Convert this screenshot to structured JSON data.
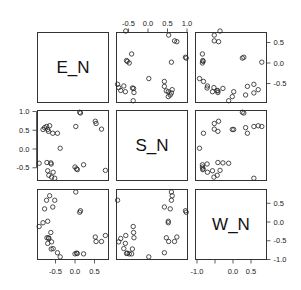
{
  "chart_data": {
    "type": "scatter",
    "subtype": "pairs-matrix",
    "title": "",
    "variables": [
      "E_N",
      "S_N",
      "W_N"
    ],
    "grid": false,
    "legend": null,
    "marker": "open-circle",
    "axes": {
      "top": {
        "column": 1,
        "ticks": [
          -0.5,
          0.0,
          0.5,
          1.0
        ],
        "labels": [
          "-0.5",
          "0.0",
          "0.5",
          "1.0"
        ]
      },
      "right_row0": {
        "ticks": [
          0.5,
          0.0,
          -0.5
        ],
        "labels": [
          "0.5",
          "0.0",
          "-0.5"
        ]
      },
      "left_row1": {
        "ticks": [
          1.0,
          0.5,
          0.0,
          -0.5
        ],
        "labels": [
          "1.0",
          "0.5",
          "0.0",
          "-0.5"
        ]
      },
      "right_row2": {
        "ticks": [
          0.5,
          0.0,
          -0.5,
          -1.0
        ],
        "labels": [
          "0.5",
          "0.0",
          "-0.5",
          "-1.0"
        ]
      },
      "bottom_col0": {
        "ticks": [
          -0.5,
          0.0,
          0.5
        ],
        "labels": [
          "-0.5",
          "0.0",
          "0.5"
        ]
      },
      "bottom_col2": {
        "ticks": [
          -1.0,
          -0.5,
          0.0,
          0.5
        ],
        "labels": [
          "-1.0",
          "",
          "0.0",
          "0.5"
        ]
      }
    },
    "ranges": {
      "E_N": [
        -0.97,
        0.85
      ],
      "S_N": [
        -0.82,
        1.03
      ],
      "W_N": [
        -1.0,
        0.85
      ]
    },
    "points": [
      {
        "E_N": -0.92,
        "S_N": -0.38,
        "W_N": -0.12
      },
      {
        "E_N": -0.82,
        "S_N": 0.52,
        "W_N": -0.02
      },
      {
        "E_N": -0.78,
        "S_N": 0.57,
        "W_N": 0.35
      },
      {
        "E_N": -0.73,
        "S_N": 0.6,
        "W_N": 0.58
      },
      {
        "E_N": -0.72,
        "S_N": -0.36,
        "W_N": -0.42
      },
      {
        "E_N": -0.7,
        "S_N": 0.52,
        "W_N": 0.02
      },
      {
        "E_N": -0.7,
        "S_N": -0.58,
        "W_N": -0.57
      },
      {
        "E_N": -0.68,
        "S_N": 0.47,
        "W_N": -0.42
      },
      {
        "E_N": -0.67,
        "S_N": -0.7,
        "W_N": -0.44
      },
      {
        "E_N": -0.65,
        "S_N": 0.62,
        "W_N": 0.7
      },
      {
        "E_N": -0.62,
        "S_N": -0.37,
        "W_N": -0.28
      },
      {
        "E_N": -0.61,
        "S_N": -0.4,
        "W_N": -0.72
      },
      {
        "E_N": -0.6,
        "S_N": -0.75,
        "W_N": -0.53
      },
      {
        "E_N": -0.57,
        "S_N": 0.42,
        "W_N": 0.4
      },
      {
        "E_N": -0.56,
        "S_N": -0.62,
        "W_N": -0.71
      },
      {
        "E_N": -0.52,
        "S_N": -0.78,
        "W_N": 0.58
      },
      {
        "E_N": -0.45,
        "S_N": 0.42,
        "W_N": -0.82
      },
      {
        "E_N": -0.38,
        "S_N": 0.02,
        "W_N": -0.93
      },
      {
        "E_N": 0.0,
        "S_N": -0.48,
        "W_N": -0.85
      },
      {
        "E_N": 0.02,
        "S_N": 0.6,
        "W_N": 0.8
      },
      {
        "E_N": 0.04,
        "S_N": -0.53,
        "W_N": -0.83
      },
      {
        "E_N": 0.06,
        "S_N": -0.55,
        "W_N": -0.84
      },
      {
        "E_N": 0.12,
        "S_N": 0.98,
        "W_N": 0.26
      },
      {
        "E_N": 0.14,
        "S_N": 0.96,
        "W_N": 0.3
      },
      {
        "E_N": 0.22,
        "S_N": -0.42,
        "W_N": -0.85
      },
      {
        "E_N": 0.52,
        "S_N": 0.74,
        "W_N": -0.4
      },
      {
        "E_N": 0.54,
        "S_N": 0.68,
        "W_N": -0.52
      },
      {
        "E_N": 0.68,
        "S_N": 0.53,
        "W_N": -0.52
      },
      {
        "E_N": 0.78,
        "S_N": -0.57,
        "W_N": -0.36
      }
    ]
  }
}
